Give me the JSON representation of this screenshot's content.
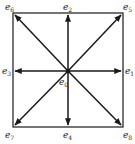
{
  "diagram": {
    "colors": {
      "line": "#1a1a1a",
      "text": "#222222",
      "background": "#ffffff"
    },
    "center": {
      "x": 68,
      "y": 71
    },
    "square": {
      "x": 13,
      "y": 13,
      "width": 110,
      "height": 114
    },
    "labels": {
      "e0": {
        "base": "e",
        "sub": "0"
      },
      "e1": {
        "base": "e",
        "sub": "1"
      },
      "e2": {
        "base": "e",
        "sub": "2"
      },
      "e3": {
        "base": "e",
        "sub": "3"
      },
      "e4": {
        "base": "e",
        "sub": "4"
      },
      "e5": {
        "base": "e",
        "sub": "5"
      },
      "e6": {
        "base": "e",
        "sub": "6"
      },
      "e7": {
        "base": "e",
        "sub": "7"
      },
      "e8": {
        "base": "e",
        "sub": "8"
      }
    },
    "vectors": [
      {
        "name": "e1",
        "direction": "east"
      },
      {
        "name": "e2",
        "direction": "north"
      },
      {
        "name": "e3",
        "direction": "west"
      },
      {
        "name": "e4",
        "direction": "south"
      },
      {
        "name": "e5",
        "direction": "north-east"
      },
      {
        "name": "e6",
        "direction": "north-west"
      },
      {
        "name": "e7",
        "direction": "south-west"
      },
      {
        "name": "e8",
        "direction": "south-east"
      }
    ]
  }
}
